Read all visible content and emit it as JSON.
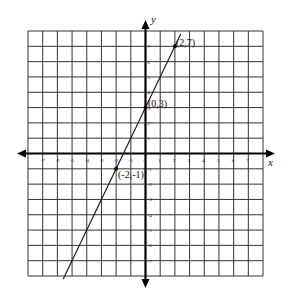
{
  "chart_data": {
    "type": "line",
    "title": "",
    "xlabel": "x",
    "ylabel": "y",
    "xlim": [
      -8,
      8
    ],
    "ylim": [
      -8,
      8
    ],
    "grid": true,
    "x_ticks": [
      -7,
      -6,
      -5,
      -4,
      -3,
      -2,
      -1,
      0,
      1,
      2,
      3,
      4,
      5,
      6,
      7
    ],
    "y_ticks": [
      -7,
      -6,
      -5,
      -4,
      -3,
      -2,
      -1,
      1,
      2,
      3,
      4,
      5,
      6,
      7
    ],
    "series": [
      {
        "name": "y = 2x + 3",
        "slope": 2,
        "intercept": 3,
        "x_range": [
          -5.6,
          2.4
        ],
        "points": [
          {
            "x": 2,
            "y": 7,
            "label": "(2,7)"
          },
          {
            "x": 0,
            "y": 3,
            "label": "(0,3)"
          },
          {
            "x": -2,
            "y": -1,
            "label": "(-2,-1)"
          }
        ]
      }
    ]
  },
  "labels": {
    "x_axis": "x",
    "y_axis": "y",
    "p1": "(2,7)",
    "p2": "(0,3)",
    "p3": "(-2,-1)"
  }
}
